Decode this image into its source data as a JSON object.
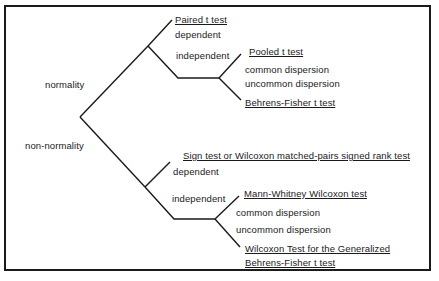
{
  "diagram": {
    "type": "decision-tree",
    "root_branches": {
      "normality": "normality",
      "non_normality": "non-normality"
    },
    "normality": {
      "dependent_label": "dependent",
      "dependent_test": "Paired t test",
      "independent_label": "independent",
      "common_label": "common dispersion",
      "common_test": "Pooled t test",
      "uncommon_label": "uncommon dispersion",
      "uncommon_test": "Behrens-Fisher t test"
    },
    "non_normality": {
      "dependent_label": "dependent",
      "dependent_test": "Sign test or Wilcoxon matched-pairs signed rank test",
      "independent_label": "independent",
      "common_label": "common dispersion",
      "common_test": "Mann-Whitney Wilcoxon test",
      "uncommon_label": "uncommon dispersion",
      "uncommon_test_line1": "Wilcoxon Test for the Generalized",
      "uncommon_test_line2": "Behrens-Fisher t test"
    }
  }
}
